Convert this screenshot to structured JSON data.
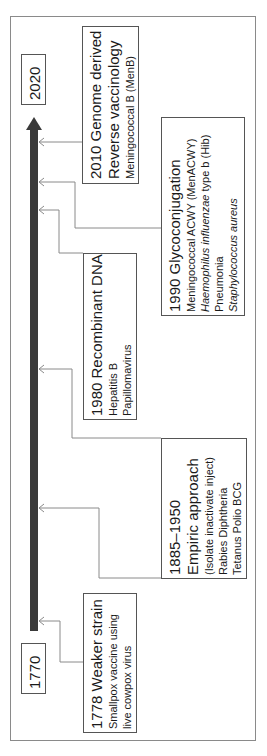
{
  "timeline": {
    "start_year": "1770",
    "end_year": "2020",
    "bar_color": "#3a3a3a",
    "line_color": "#8a8a8a"
  },
  "events": [
    {
      "title": "1778 Weaker strain",
      "lines": [
        "Smallpox vaccine using",
        "live cowpox virus"
      ]
    },
    {
      "title_line1": "1885–1950",
      "title_line2": "Empiric approach",
      "lines": [
        "(Isolate inactivate inject)",
        "Rabies Diphtheria",
        "Tetanus Polio BCG"
      ]
    },
    {
      "title": "1980 Recombinant DNA",
      "lines": [
        "Hepatitis B",
        "Papillomavirus"
      ]
    },
    {
      "title": "1990 Glycoconjugation",
      "lines": [
        "Meningococcal ACWY (MenACWY)",
        "Haemophilus influenzae",
        " type b (Hib)",
        "Pneumonia",
        "Staphylococcus aureus"
      ]
    },
    {
      "title_line1": "2010 Genome derived",
      "title_line2": "Reverse vaccinology",
      "lines": [
        "Meningococcal B (MenB)"
      ]
    }
  ]
}
